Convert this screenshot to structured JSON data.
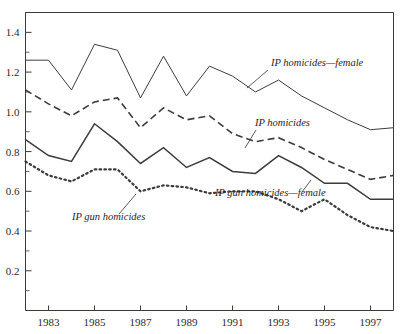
{
  "chart_data": {
    "type": "line",
    "title": "",
    "subtitle": "",
    "xlabel": "",
    "ylabel": "",
    "x": [
      1982,
      1983,
      1984,
      1985,
      1986,
      1987,
      1988,
      1989,
      1990,
      1991,
      1992,
      1993,
      1994,
      1995,
      1996,
      1997,
      1998
    ],
    "xlim": [
      1982,
      1998
    ],
    "ylim": [
      0.0,
      1.5
    ],
    "xticks": [
      1983,
      1985,
      1987,
      1989,
      1991,
      1993,
      1995,
      1997
    ],
    "xtick_labels": [
      "1983",
      "1985",
      "1987",
      "1989",
      "1991",
      "1993",
      "1995",
      "1997"
    ],
    "yticks": [
      0.2,
      0.4,
      0.6,
      0.8,
      1.0,
      1.2,
      1.4
    ],
    "ytick_labels": [
      "0.2",
      "0.4",
      "0.6",
      "0.8",
      "1.0",
      "1.2",
      "1.4"
    ],
    "yticks_minor": [
      0.1,
      0.3,
      0.5,
      0.7,
      0.9,
      1.1,
      1.3,
      1.5
    ],
    "grid": false,
    "legend_position": "inline-annotations",
    "series": [
      {
        "name": "IP homicides—female",
        "style": "solid-thin",
        "values": [
          1.26,
          1.26,
          1.11,
          1.34,
          1.31,
          1.07,
          1.28,
          1.08,
          1.23,
          1.18,
          1.1,
          1.16,
          1.08,
          1.02,
          0.96,
          0.91,
          0.92
        ]
      },
      {
        "name": "IP homicides",
        "style": "dashed",
        "values": [
          1.11,
          1.04,
          0.98,
          1.05,
          1.07,
          0.92,
          1.02,
          0.96,
          0.98,
          0.89,
          0.85,
          0.87,
          0.82,
          0.76,
          0.71,
          0.66,
          0.68
        ]
      },
      {
        "name": "IP gun homicides—female",
        "style": "solid-mid",
        "values": [
          0.86,
          0.78,
          0.75,
          0.94,
          0.85,
          0.74,
          0.82,
          0.72,
          0.77,
          0.7,
          0.69,
          0.78,
          0.72,
          0.64,
          0.64,
          0.56,
          0.56
        ]
      },
      {
        "name": "IP gun homicides",
        "style": "dotted",
        "values": [
          0.75,
          0.68,
          0.65,
          0.71,
          0.71,
          0.6,
          0.63,
          0.62,
          0.59,
          0.6,
          0.6,
          0.56,
          0.5,
          0.56,
          0.48,
          0.42,
          0.4
        ]
      }
    ],
    "annotations": [
      {
        "text": "IP homicides—female",
        "text_x": 271,
        "text_y": 66,
        "leader": "M 268 70 L 247 88"
      },
      {
        "text": "IP homicides",
        "text_x": 255,
        "text_y": 126,
        "leader": "M 256 130 L 245 148"
      },
      {
        "text": "IP gun homicides—female",
        "text_x": 215,
        "text_y": 196,
        "leader": "M 302 192 L 311 180"
      },
      {
        "text": "IP gun homicides",
        "text_x": 72,
        "text_y": 220,
        "leader": "M 119 214 L 136 194"
      }
    ],
    "colors": {
      "axis": "#3a3a3a",
      "series": "#3c3c3c",
      "background": "#ffffff"
    }
  }
}
